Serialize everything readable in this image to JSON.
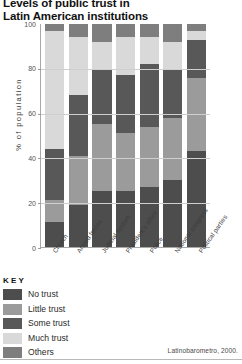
{
  "title": {
    "line1": "Levels of public trust in",
    "line2": "Latin American institutions"
  },
  "axis": {
    "ylabel": "% of population",
    "yticks": [
      "100",
      "80",
      "60",
      "40",
      "20",
      "0"
    ],
    "ylim_min": 0,
    "ylim_max": 100
  },
  "key": {
    "heading": "KEY",
    "items": [
      {
        "label": "No trust",
        "color": "#4d4d4d"
      },
      {
        "label": "Little trust",
        "color": "#9b9b9b"
      },
      {
        "label": "Some trust",
        "color": "#585858"
      },
      {
        "label": "Much trust",
        "color": "#d9d9d9"
      },
      {
        "label": "Others",
        "color": "#7e7e7e"
      }
    ]
  },
  "source": "Latinobarometro, 2000.",
  "chart_data": {
    "type": "bar",
    "subtype": "stacked-100",
    "title": "Levels of public trust in Latin American institutions",
    "xlabel": "",
    "ylabel": "% of population",
    "ylim": [
      0,
      100
    ],
    "grid": true,
    "legend_position": "below-left",
    "categories": [
      "Church",
      "Armed forces",
      "Judicial system",
      "President's office",
      "Police",
      "National congress",
      "Political parties"
    ],
    "series": [
      {
        "name": "No trust",
        "color": "#4d4d4d",
        "values": [
          11,
          19,
          25,
          25,
          27,
          30,
          43
        ]
      },
      {
        "name": "Little trust",
        "color": "#9b9b9b",
        "values": [
          10,
          22,
          30,
          26,
          27,
          28,
          33
        ]
      },
      {
        "name": "Some trust",
        "color": "#585858",
        "values": [
          23,
          27,
          25,
          26,
          28,
          22,
          17
        ]
      },
      {
        "name": "Much trust",
        "color": "#d9d9d9",
        "values": [
          53,
          26,
          12,
          17,
          12,
          12,
          4
        ]
      },
      {
        "name": "Others",
        "color": "#7e7e7e",
        "values": [
          3,
          6,
          8,
          6,
          6,
          8,
          3
        ]
      }
    ]
  }
}
